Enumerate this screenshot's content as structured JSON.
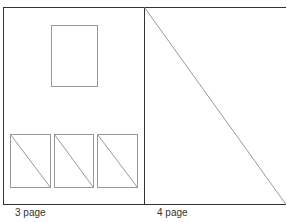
{
  "pages": [
    {
      "label": "3 page",
      "layout": "image-top-three-thumbnails-bottom"
    },
    {
      "label": "4 page",
      "layout": "full-page-image-placeholder"
    }
  ],
  "colors": {
    "frame": "#333333",
    "placeholder": "#999999",
    "background": "#ffffff"
  }
}
